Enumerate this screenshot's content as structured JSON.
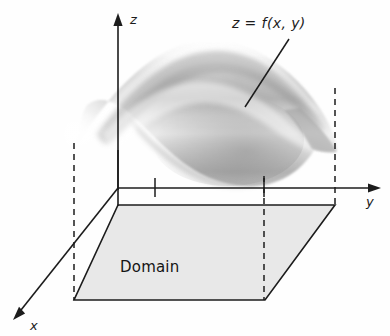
{
  "figure": {
    "background_color": "#fefefe",
    "line_color": "#1c1c1c",
    "domain_fill_color": "#e8e8e8",
    "surface_light_color": "#f2f2f2",
    "surface_mid_color": "#c9c9c9",
    "surface_dark_color": "#9a9a9a"
  },
  "axes": {
    "z": {
      "label": "z",
      "label_x": 130,
      "label_y": 21,
      "line": {
        "x1": 118,
        "y1": 19,
        "x2": 118,
        "y2": 188
      },
      "arrow": "up"
    },
    "y": {
      "label": "y",
      "label_x": 368,
      "label_y": 203,
      "line": {
        "x1": 118,
        "y1": 188,
        "x2": 375,
        "y2": 188
      },
      "arrow": "right"
    },
    "x": {
      "label": "x",
      "label_x": 29,
      "label_y": 327,
      "line": {
        "x1": 118,
        "y1": 188,
        "x2": 14,
        "y2": 318
      },
      "arrow": "down-left"
    }
  },
  "surface": {
    "label": "z = f(x, y)",
    "label_x": 232,
    "label_y": 26,
    "leader_line": {
      "x1": 288,
      "y1": 40,
      "x2": 245,
      "y2": 107
    }
  },
  "domain": {
    "label": "Domain",
    "label_x": 121,
    "label_y": 270,
    "corners": [
      {
        "name": "back-left",
        "x": 118,
        "y": 205
      },
      {
        "name": "back-right",
        "x": 335,
        "y": 205
      },
      {
        "name": "front-right",
        "x": 265,
        "y": 300
      },
      {
        "name": "front-left",
        "x": 74,
        "y": 300
      }
    ]
  },
  "projection_lines": [
    {
      "name": "left-dashed",
      "x": 74,
      "y1": 143,
      "y2": 300
    },
    {
      "name": "front-right-dashed",
      "x": 264,
      "y1": 176,
      "y2": 300
    },
    {
      "name": "back-right-dashed",
      "x": 335,
      "y1": 88,
      "y2": 205
    },
    {
      "name": "tick-dashed-center",
      "x": 155,
      "y1": 176,
      "y2": 196
    },
    {
      "name": "tick-dashed-right",
      "x": 264,
      "y1": 176,
      "y2": 196
    }
  ],
  "vertical_edges": [
    {
      "name": "z-axis-to-origin",
      "x": 118,
      "y1": 150,
      "y2": 188
    }
  ]
}
